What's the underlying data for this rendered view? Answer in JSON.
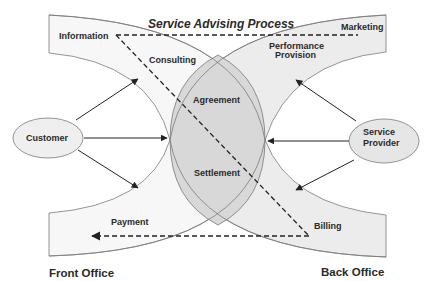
{
  "title": "Service Advising Process",
  "actors": {
    "customer": "Customer",
    "provider_line1": "Service",
    "provider_line2": "Provider"
  },
  "front_office": {
    "label": "Front Office",
    "phases": [
      "Information",
      "Consulting",
      "Payment"
    ]
  },
  "back_office": {
    "label": "Back Office",
    "phases": [
      "Marketing",
      "Performance",
      "Provision",
      "Billing"
    ]
  },
  "overlap": {
    "phases": [
      "Agreement",
      "Settlement"
    ]
  },
  "colors": {
    "band_fill": "#f3f3f3",
    "back_band_fill": "#e9e9e9",
    "lens_fill": "#d9d9d9",
    "stroke": "#7a7a7a",
    "arrow": "#222222",
    "text": "#2a2a2a"
  }
}
